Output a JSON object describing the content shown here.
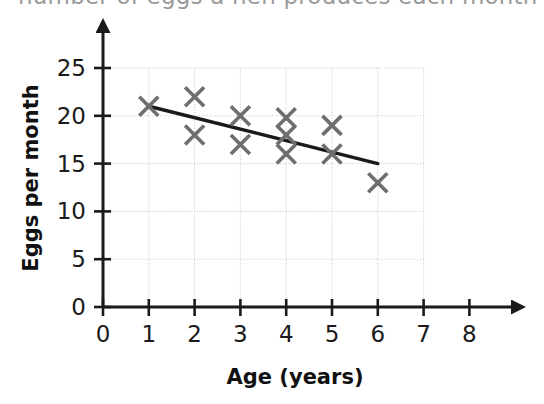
{
  "title": {
    "text": "number of eggs a hen produces each month",
    "cutoff": true
  },
  "chart_data": {
    "type": "scatter",
    "title": "number of eggs a hen produces each month",
    "xlabel": "Age (years)",
    "ylabel": "Eggs per month",
    "xlim": [
      0,
      8
    ],
    "ylim": [
      0,
      25
    ],
    "xticks": [
      "0",
      "1",
      "2",
      "3",
      "4",
      "5",
      "6",
      "7",
      "8"
    ],
    "yticks": [
      "0",
      "5",
      "10",
      "15",
      "20",
      "25"
    ],
    "grid": true,
    "grid_color": "#c9c9c9",
    "marker": "x-cross",
    "marker_color": "#6e6e6e",
    "legend": "none",
    "points": [
      {
        "x": 1,
        "y": 21
      },
      {
        "x": 2,
        "y": 22
      },
      {
        "x": 2,
        "y": 18
      },
      {
        "x": 3,
        "y": 20
      },
      {
        "x": 3,
        "y": 17
      },
      {
        "x": 4,
        "y": 19.8
      },
      {
        "x": 4,
        "y": 18
      },
      {
        "x": 4,
        "y": 16
      },
      {
        "x": 5,
        "y": 19
      },
      {
        "x": 5,
        "y": 16
      },
      {
        "x": 6,
        "y": 13
      }
    ],
    "trend_line": {
      "color": "#1a1a1a",
      "x_start": 1,
      "y_start": 21,
      "x_end": 6,
      "y_end": 15
    }
  },
  "axes": {
    "x_arrow": true,
    "y_arrow": true,
    "axis_color": "#1a1a1a"
  }
}
